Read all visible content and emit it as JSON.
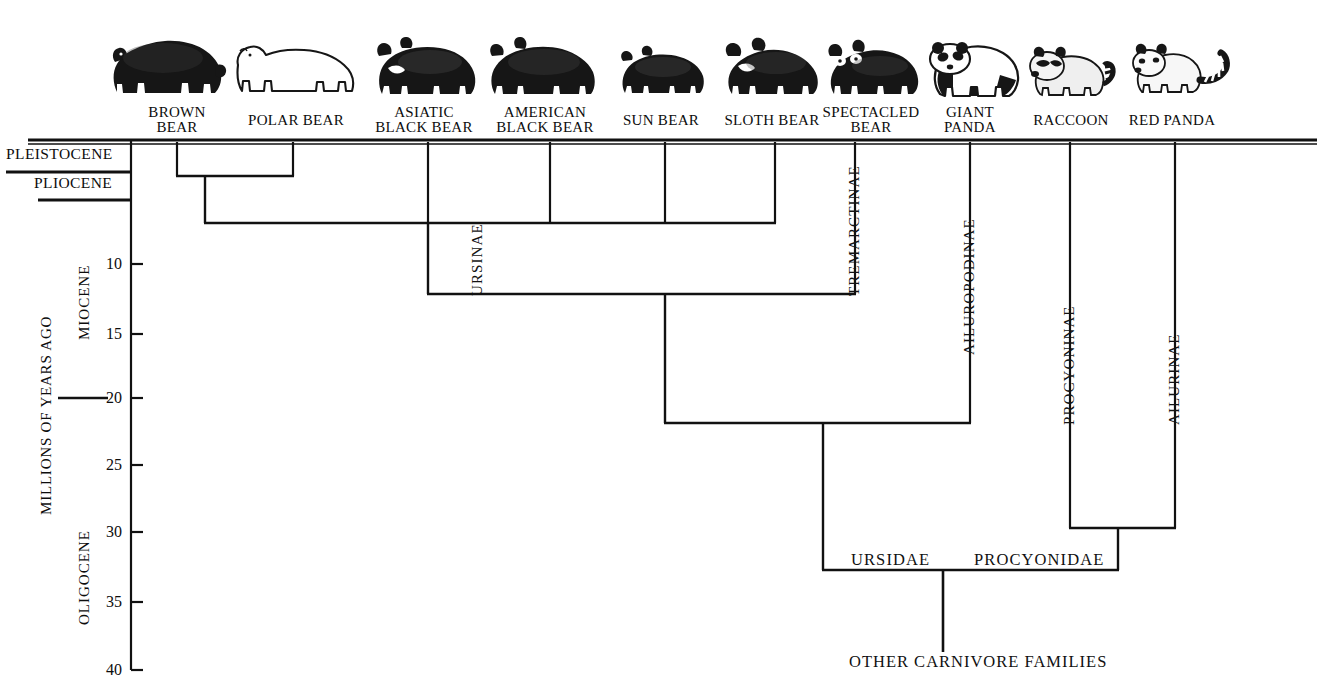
{
  "figure": {
    "type": "phylogenetic-tree",
    "axis_title": "MILLIONS OF YEARS AGO"
  },
  "taxa": [
    {
      "id": "brown-bear",
      "label": "BROWN\nBEAR",
      "x": 177,
      "label_cx": 177,
      "icon": "brown-bear-icon"
    },
    {
      "id": "polar-bear",
      "label": "POLAR BEAR",
      "x": 293,
      "label_cx": 296,
      "icon": "polar-bear-icon"
    },
    {
      "id": "asiatic-black-bear",
      "label": "ASIATIC\nBLACK BEAR",
      "x": 428,
      "label_cx": 424,
      "icon": "asiatic-black-bear-icon"
    },
    {
      "id": "american-black-bear",
      "label": "AMERICAN\nBLACK BEAR",
      "x": 550,
      "label_cx": 545,
      "icon": "american-black-bear-icon"
    },
    {
      "id": "sun-bear",
      "label": "SUN BEAR",
      "x": 665,
      "label_cx": 661,
      "icon": "sun-bear-icon"
    },
    {
      "id": "sloth-bear",
      "label": "SLOTH BEAR",
      "x": 775,
      "label_cx": 772,
      "icon": "sloth-bear-icon"
    },
    {
      "id": "spectacled-bear",
      "label": "SPECTACLED\nBEAR",
      "x": 855,
      "label_cx": 871,
      "icon": "spectacled-bear-icon"
    },
    {
      "id": "giant-panda",
      "label": "GIANT\nPANDA",
      "x": 970,
      "label_cx": 970,
      "icon": "giant-panda-icon"
    },
    {
      "id": "raccoon",
      "label": "RACCOON",
      "x": 1070,
      "label_cx": 1071,
      "icon": "raccoon-icon"
    },
    {
      "id": "red-panda",
      "label": "RED PANDA",
      "x": 1175,
      "label_cx": 1172,
      "icon": "red-panda-icon"
    }
  ],
  "epochs": [
    {
      "id": "pleistocene",
      "label": "PLEISTOCENE",
      "orientation": "horizontal",
      "x": 6,
      "y": 143,
      "rule_top": 141,
      "rule_bottom": 172,
      "rule_x1": 6,
      "rule_x2": 131
    },
    {
      "id": "pliocene",
      "label": "PLIOCENE",
      "orientation": "horizontal",
      "x": 32,
      "y": 175,
      "rule_top": 172,
      "rule_bottom": 200,
      "rule_x1": 38,
      "rule_x2": 131
    },
    {
      "id": "miocene",
      "label": "MIOCENE",
      "orientation": "vertical",
      "x": 76,
      "y": 336
    },
    {
      "id": "oligocene",
      "label": "OLIGOCENE",
      "orientation": "vertical",
      "x": 76,
      "y": 618
    }
  ],
  "epoch_divider": {
    "id": "miocene-oligocene-divider",
    "y": 398,
    "x1": 58,
    "x2": 108
  },
  "axis": {
    "x": 131,
    "y_top": 141,
    "y_bottom": 670,
    "ticks": [
      {
        "value": "10",
        "y": 264
      },
      {
        "value": "15",
        "y": 334
      },
      {
        "value": "20",
        "y": 398
      },
      {
        "value": "25",
        "y": 465
      },
      {
        "value": "30",
        "y": 532
      },
      {
        "value": "35",
        "y": 602
      },
      {
        "value": "40",
        "y": 670
      }
    ]
  },
  "clades": [
    {
      "id": "ursinae",
      "label": "URSINAE",
      "x": 470,
      "y": 296
    },
    {
      "id": "tremarctinae",
      "label": "TREMARCTINAE",
      "x": 845,
      "y": 296
    },
    {
      "id": "ailuropodinae",
      "label": "AILUROPODINAE",
      "x": 960,
      "y": 353
    },
    {
      "id": "procyoninae",
      "label": "PROCYONINAE",
      "x": 1060,
      "y": 420
    },
    {
      "id": "ailurinae",
      "label": "AILURINAE",
      "x": 1165,
      "y": 420
    }
  ],
  "families": [
    {
      "id": "ursidae",
      "label": "URSIDAE",
      "x": 852,
      "y": 550
    },
    {
      "id": "procyonidae",
      "label": "PROCYONIDAE",
      "x": 975,
      "y": 550
    }
  ],
  "root": {
    "id": "other-carnivore-families",
    "label": "OTHER CARNIVORE FAMILIES",
    "x": 851,
    "y": 655
  },
  "tree_data": {
    "top_rail_y": 141,
    "nodes": [
      {
        "id": "n-brown-polar",
        "depth_my": 1.8,
        "y": 176,
        "children_x": [
          177,
          293
        ],
        "stem_x": 205
      },
      {
        "id": "n-ursine-core",
        "depth_my": 7.0,
        "y": 223,
        "children_x": [
          205,
          775
        ],
        "stem_x": 428
      },
      {
        "id": "n-ursinae",
        "depth_my": 12.3,
        "y": 294,
        "children_x": [
          428,
          855
        ],
        "stem_x": 665
      },
      {
        "id": "n-ursidae",
        "depth_my": 21.5,
        "y": 423,
        "children_x": [
          665,
          970
        ],
        "stem_x": 823
      },
      {
        "id": "n-procyonidae",
        "depth_my": 29.5,
        "y": 528,
        "children_x": [
          1070,
          1175
        ],
        "stem_x": 1118
      },
      {
        "id": "n-arctoidea",
        "depth_my": 33.0,
        "y": 570,
        "children_x": [
          823,
          1118
        ],
        "stem_x": 943
      },
      {
        "id": "n-root",
        "depth_my": 40.0,
        "y": 652,
        "children_x": [
          943
        ],
        "stem_x": 943
      }
    ],
    "terminal_branches": [
      {
        "taxon": "brown-bear",
        "x": 177,
        "y_end": 176
      },
      {
        "taxon": "polar-bear",
        "x": 293,
        "y_end": 176
      },
      {
        "taxon": "asiatic-black-bear",
        "x": 428,
        "y_end": 223
      },
      {
        "taxon": "american-black-bear",
        "x": 550,
        "y_end": 223
      },
      {
        "taxon": "sun-bear",
        "x": 665,
        "y_end": 223
      },
      {
        "taxon": "sloth-bear",
        "x": 775,
        "y_end": 223
      },
      {
        "taxon": "spectacled-bear",
        "x": 855,
        "y_end": 294
      },
      {
        "taxon": "giant-panda",
        "x": 970,
        "y_end": 423
      },
      {
        "taxon": "raccoon",
        "x": 1070,
        "y_end": 528
      },
      {
        "taxon": "red-panda",
        "x": 1175,
        "y_end": 528
      }
    ]
  },
  "colors": {
    "ink": "#111111",
    "background": "#ffffff"
  }
}
